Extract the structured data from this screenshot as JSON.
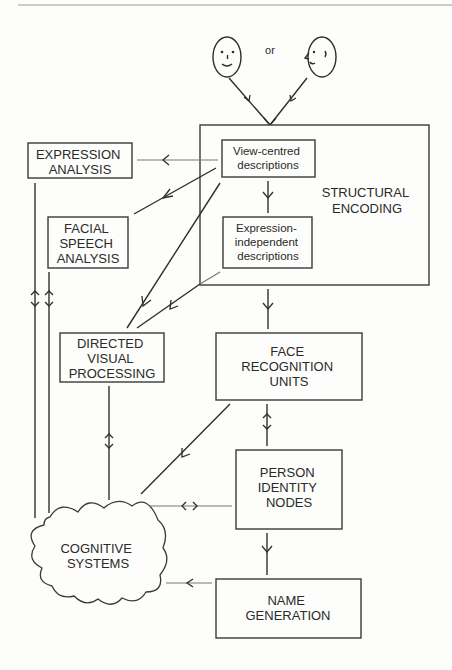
{
  "diagram": {
    "or_label": "or",
    "faces": [
      {
        "name": "front-view-face"
      },
      {
        "name": "profile-face"
      }
    ],
    "nodes": {
      "structural_encoding": {
        "lines": [
          "STRUCTURAL",
          "ENCODING"
        ]
      },
      "view_centred": {
        "lines": [
          "View-centred",
          "descriptions"
        ]
      },
      "expression_independent": {
        "lines": [
          "Expression-",
          "independent",
          "descriptions"
        ]
      },
      "expression_analysis": {
        "lines": [
          "EXPRESSION",
          "ANALYSIS"
        ]
      },
      "facial_speech": {
        "lines": [
          "FACIAL",
          "SPEECH",
          "ANALYSIS"
        ]
      },
      "directed_visual": {
        "lines": [
          "DIRECTED",
          "VISUAL",
          "PROCESSING"
        ]
      },
      "face_recognition_units": {
        "lines": [
          "FACE",
          "RECOGNITION",
          "UNITS"
        ]
      },
      "person_identity_nodes": {
        "lines": [
          "PERSON",
          "IDENTITY",
          "NODES"
        ]
      },
      "name_generation": {
        "lines": [
          "NAME",
          "GENERATION"
        ]
      },
      "cognitive_systems": {
        "lines": [
          "COGNITIVE",
          "SYSTEMS"
        ]
      }
    },
    "edges": [
      {
        "from": "faces",
        "to": "structural_encoding",
        "type": "one-way"
      },
      {
        "from": "view_centred",
        "to": "expression_analysis",
        "type": "one-way"
      },
      {
        "from": "view_centred",
        "to": "facial_speech",
        "type": "one-way"
      },
      {
        "from": "view_centred",
        "to": "directed_visual",
        "type": "one-way"
      },
      {
        "from": "view_centred",
        "to": "expression_independent",
        "type": "one-way"
      },
      {
        "from": "expression_independent",
        "to": "directed_visual",
        "type": "one-way"
      },
      {
        "from": "structural_encoding",
        "to": "face_recognition_units",
        "type": "one-way"
      },
      {
        "from": "face_recognition_units",
        "to": "person_identity_nodes",
        "type": "two-way"
      },
      {
        "from": "face_recognition_units",
        "to": "cognitive_systems",
        "type": "one-way"
      },
      {
        "from": "person_identity_nodes",
        "to": "cognitive_systems",
        "type": "two-way"
      },
      {
        "from": "person_identity_nodes",
        "to": "name_generation",
        "type": "one-way"
      },
      {
        "from": "name_generation",
        "to": "cognitive_systems",
        "type": "one-way"
      },
      {
        "from": "expression_analysis",
        "to": "cognitive_systems",
        "type": "two-way"
      },
      {
        "from": "facial_speech",
        "to": "cognitive_systems",
        "type": "two-way"
      },
      {
        "from": "directed_visual",
        "to": "cognitive_systems",
        "type": "two-way"
      }
    ]
  }
}
